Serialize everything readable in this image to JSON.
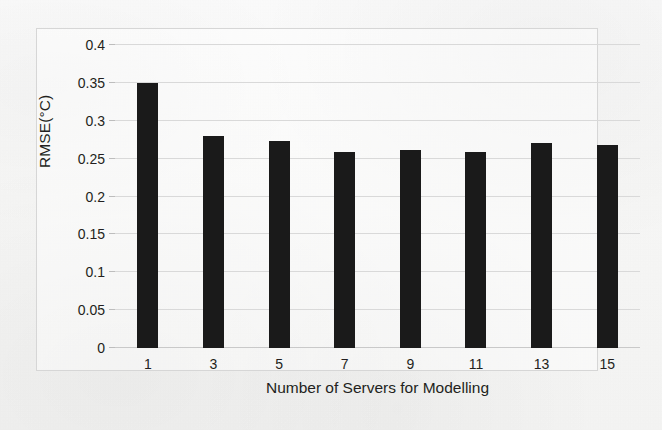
{
  "chart_data": {
    "type": "bar",
    "title": "",
    "xlabel": "Number of Servers for Modelling",
    "ylabel": "RMSE(°C)",
    "categories": [
      "1",
      "3",
      "5",
      "7",
      "9",
      "11",
      "13",
      "15"
    ],
    "values": [
      0.35,
      0.28,
      0.273,
      0.259,
      0.262,
      0.259,
      0.271,
      0.268
    ],
    "series": [
      {
        "name": "RMSE",
        "values": [
          0.35,
          0.28,
          0.273,
          0.259,
          0.262,
          0.259,
          0.271,
          0.268
        ]
      }
    ],
    "ylim": [
      0,
      0.4
    ],
    "ytick_labels": [
      "0",
      "0.05",
      "0.1",
      "0.15",
      "0.2",
      "0.25",
      "0.3",
      "0.35",
      "0.4"
    ],
    "ytick_values": [
      0,
      0.05,
      0.1,
      0.15,
      0.2,
      0.25,
      0.3,
      0.35,
      0.4
    ],
    "xtick_labels": [
      "1",
      "3",
      "5",
      "7",
      "9",
      "11",
      "13",
      "15"
    ],
    "grid": "horizontal",
    "legend": "none",
    "bar_color": "#1a1a1a",
    "gridline_color": "#d9d9d9",
    "frame_color": "#d6d6d6",
    "text_color": "#231f20",
    "background_color": "#f7f7f6"
  }
}
